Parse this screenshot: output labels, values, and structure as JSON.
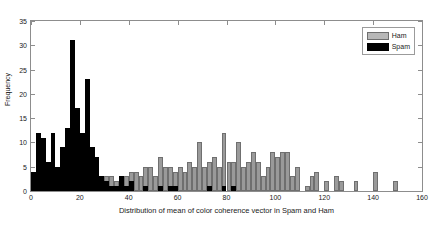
{
  "chart_data": {
    "type": "bar",
    "title": "",
    "xlabel": "Distribution of mean of color coherence vector in Spam and Ham",
    "ylabel": "Frequency",
    "xlim": [
      0,
      160
    ],
    "ylim": [
      0,
      35
    ],
    "xticks": [
      0,
      20,
      40,
      60,
      80,
      100,
      120,
      140,
      160
    ],
    "yticks": [
      0,
      5,
      10,
      15,
      20,
      25,
      30,
      35
    ],
    "grid": false,
    "legend_position": "top-right",
    "legend": [
      {
        "name": "Ham",
        "color": "#9a9a9a"
      },
      {
        "name": "Spam",
        "color": "#000000"
      }
    ],
    "bin_width": 2,
    "series": [
      {
        "name": "Spam",
        "color": "#000000",
        "points": [
          {
            "x": 1,
            "y": 4
          },
          {
            "x": 3,
            "y": 12
          },
          {
            "x": 5,
            "y": 11
          },
          {
            "x": 7,
            "y": 6
          },
          {
            "x": 9,
            "y": 12
          },
          {
            "x": 11,
            "y": 5
          },
          {
            "x": 13,
            "y": 9
          },
          {
            "x": 15,
            "y": 13
          },
          {
            "x": 17,
            "y": 31
          },
          {
            "x": 19,
            "y": 17
          },
          {
            "x": 21,
            "y": 12
          },
          {
            "x": 23,
            "y": 23
          },
          {
            "x": 25,
            "y": 9
          },
          {
            "x": 27,
            "y": 7
          },
          {
            "x": 29,
            "y": 3
          },
          {
            "x": 31,
            "y": 2
          },
          {
            "x": 33,
            "y": 1
          },
          {
            "x": 35,
            "y": 1
          },
          {
            "x": 37,
            "y": 3
          },
          {
            "x": 39,
            "y": 1
          },
          {
            "x": 41,
            "y": 2
          },
          {
            "x": 47,
            "y": 1
          },
          {
            "x": 53,
            "y": 1
          },
          {
            "x": 57,
            "y": 1
          },
          {
            "x": 59,
            "y": 1
          },
          {
            "x": 73,
            "y": 1
          },
          {
            "x": 79,
            "y": 1
          },
          {
            "x": 83,
            "y": 1
          }
        ]
      },
      {
        "name": "Ham",
        "color": "#9a9a9a",
        "points": [
          {
            "x": 29,
            "y": 2
          },
          {
            "x": 31,
            "y": 3
          },
          {
            "x": 33,
            "y": 3
          },
          {
            "x": 35,
            "y": 2
          },
          {
            "x": 37,
            "y": 2
          },
          {
            "x": 39,
            "y": 3
          },
          {
            "x": 41,
            "y": 4
          },
          {
            "x": 43,
            "y": 4
          },
          {
            "x": 45,
            "y": 3
          },
          {
            "x": 47,
            "y": 5
          },
          {
            "x": 49,
            "y": 5
          },
          {
            "x": 51,
            "y": 3
          },
          {
            "x": 53,
            "y": 7
          },
          {
            "x": 55,
            "y": 5
          },
          {
            "x": 57,
            "y": 5
          },
          {
            "x": 59,
            "y": 4
          },
          {
            "x": 61,
            "y": 5
          },
          {
            "x": 63,
            "y": 4
          },
          {
            "x": 65,
            "y": 6
          },
          {
            "x": 67,
            "y": 5
          },
          {
            "x": 69,
            "y": 10
          },
          {
            "x": 71,
            "y": 5
          },
          {
            "x": 73,
            "y": 6
          },
          {
            "x": 75,
            "y": 7
          },
          {
            "x": 77,
            "y": 5
          },
          {
            "x": 79,
            "y": 12
          },
          {
            "x": 81,
            "y": 6
          },
          {
            "x": 83,
            "y": 6
          },
          {
            "x": 85,
            "y": 10
          },
          {
            "x": 87,
            "y": 5
          },
          {
            "x": 89,
            "y": 6
          },
          {
            "x": 91,
            "y": 8
          },
          {
            "x": 93,
            "y": 6
          },
          {
            "x": 95,
            "y": 3
          },
          {
            "x": 97,
            "y": 5
          },
          {
            "x": 99,
            "y": 8
          },
          {
            "x": 101,
            "y": 7
          },
          {
            "x": 103,
            "y": 8
          },
          {
            "x": 105,
            "y": 8
          },
          {
            "x": 107,
            "y": 3
          },
          {
            "x": 109,
            "y": 5
          },
          {
            "x": 113,
            "y": 1
          },
          {
            "x": 115,
            "y": 3
          },
          {
            "x": 117,
            "y": 4
          },
          {
            "x": 121,
            "y": 2
          },
          {
            "x": 125,
            "y": 3
          },
          {
            "x": 127,
            "y": 2
          },
          {
            "x": 133,
            "y": 2
          },
          {
            "x": 141,
            "y": 4
          },
          {
            "x": 149,
            "y": 2
          }
        ]
      }
    ]
  }
}
